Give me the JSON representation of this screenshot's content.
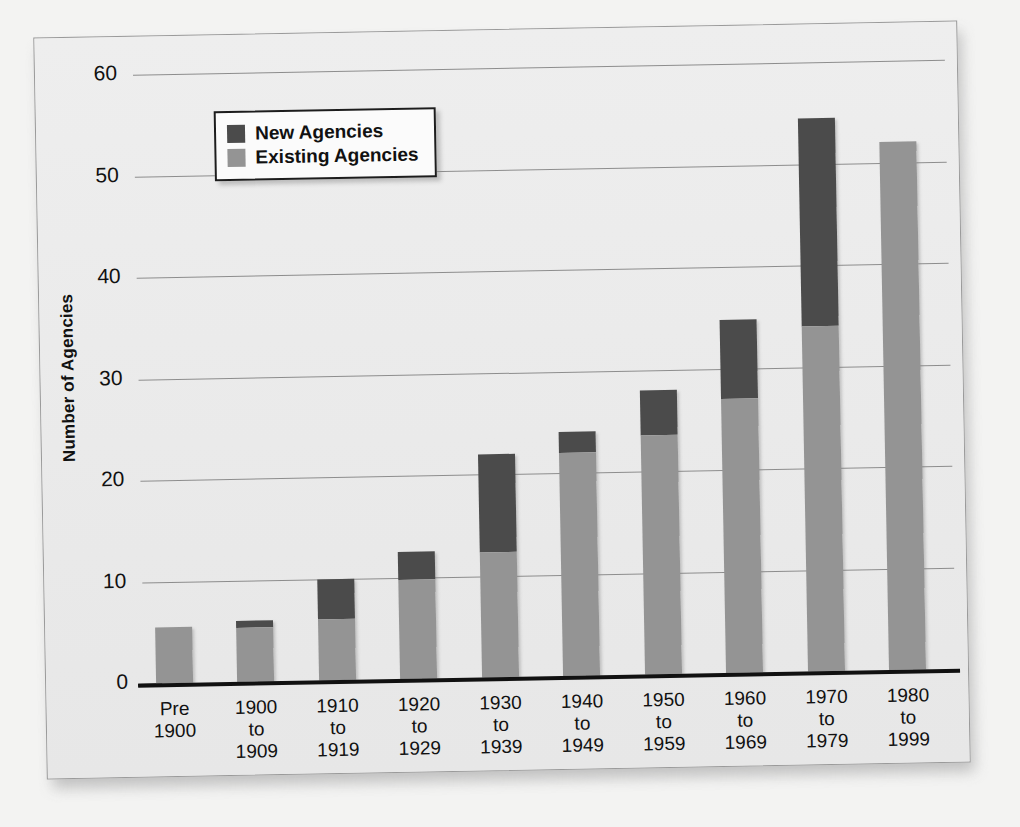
{
  "chart_data": {
    "type": "bar",
    "subtype": "stacked-bar",
    "title": "",
    "xlabel": "",
    "ylabel": "Number of Agencies",
    "ylim": [
      0,
      60
    ],
    "yticks": [
      0,
      10,
      20,
      30,
      40,
      50,
      60
    ],
    "grid": true,
    "legend_position": "top-left-inside",
    "categories": [
      "Pre 1900",
      "1900 to 1909",
      "1910 to 1919",
      "1920 to 1929",
      "1930 to 1939",
      "1940 to 1949",
      "1950 to 1959",
      "1960 to 1969",
      "1970 to 1979",
      "1980 to 1999"
    ],
    "category_lines": [
      [
        "Pre",
        "1900",
        ""
      ],
      [
        "1900",
        "to",
        "1909"
      ],
      [
        "1910",
        "to",
        "1919"
      ],
      [
        "1920",
        "to",
        "1929"
      ],
      [
        "1930",
        "to",
        "1939"
      ],
      [
        "1940",
        "to",
        "1949"
      ],
      [
        "1950",
        "to",
        "1959"
      ],
      [
        "1960",
        "to",
        "1969"
      ],
      [
        "1970",
        "to",
        "1979"
      ],
      [
        "1980",
        "to",
        "1999"
      ]
    ],
    "series": [
      {
        "name": "Existing Agencies",
        "color": "#949494",
        "values": [
          5.5,
          5.3,
          6.0,
          9.8,
          12.3,
          22.0,
          23.5,
          27.0,
          34.0,
          52.0
        ]
      },
      {
        "name": "New Agencies",
        "color": "#4b4b4b",
        "values": [
          0.0,
          0.7,
          4.0,
          2.7,
          9.7,
          2.0,
          4.5,
          7.8,
          20.5,
          0.0
        ]
      }
    ],
    "totals": [
      5.5,
      6.0,
      10.0,
      12.5,
      22.0,
      24.0,
      28.0,
      34.8,
      54.5,
      52.0
    ]
  },
  "legend": {
    "items": [
      {
        "label": "New Agencies",
        "color": "#4b4b4b"
      },
      {
        "label": "Existing Agencies",
        "color": "#949494"
      }
    ]
  },
  "axis": {
    "y_title": "Number of Agencies"
  }
}
